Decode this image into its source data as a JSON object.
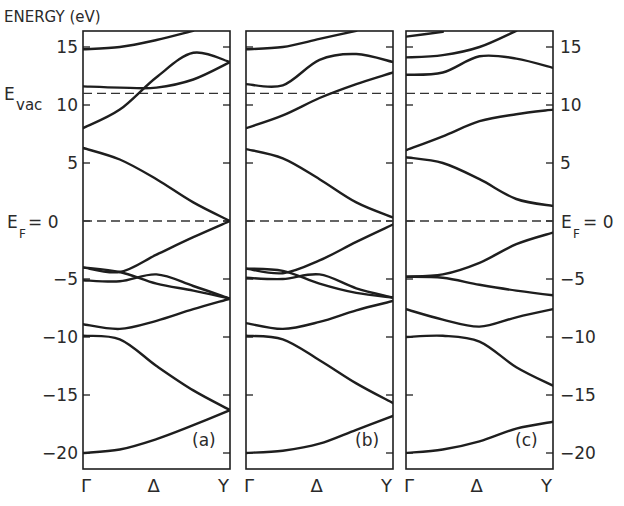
{
  "chart_data": {
    "type": "line",
    "title": "",
    "ylabel": "ENERGY (eV)",
    "xlabel": "",
    "ylim": [
      -20.7,
      16.4
    ],
    "yticks": [
      15,
      10,
      5,
      0,
      -5,
      -10,
      -15,
      -20
    ],
    "ytick_labels": [
      "15",
      "10",
      "5",
      "0",
      "-5",
      "-10",
      "-15",
      "-20"
    ],
    "left_axis_labels": [
      "15",
      "10",
      "5",
      "-5",
      "-10",
      "-15",
      "-20"
    ],
    "right_axis_labels": [
      "15",
      "10",
      "5",
      "-5",
      "-10",
      "-15",
      "-20"
    ],
    "grid": false,
    "x_ticks": [
      "Γ",
      "Δ",
      "Y"
    ],
    "reference_lines": [
      {
        "name": "E_vac",
        "label_main": "E",
        "label_sub": "vac",
        "energy": 11.0,
        "style": "dashed"
      },
      {
        "name": "E_F",
        "label_main": "E",
        "label_sub": "F",
        "label_suffix": "= 0",
        "energy": 0.0,
        "style": "dashed"
      }
    ],
    "panels": [
      {
        "label": "(a)",
        "x": [
          0,
          0.25,
          0.5,
          0.75,
          1.0
        ],
        "bands": [
          {
            "name": "c3",
            "values": [
              14.8,
              15.0,
              15.6,
              16.4,
              null
            ]
          },
          {
            "name": "c2a",
            "values": [
              11.6,
              11.5,
              11.5,
              12.2,
              13.7
            ]
          },
          {
            "name": "c2b",
            "values": [
              8.0,
              9.6,
              12.4,
              14.5,
              13.7
            ]
          },
          {
            "name": "v1",
            "values": [
              6.3,
              5.3,
              3.6,
              1.6,
              0.0
            ]
          },
          {
            "name": "v2a",
            "values": [
              -4.0,
              -4.4,
              -2.9,
              -1.4,
              0.0
            ]
          },
          {
            "name": "v2b",
            "values": [
              -5.1,
              -5.2,
              -4.6,
              -5.6,
              -6.7
            ]
          },
          {
            "name": "v3a",
            "values": [
              -4.0,
              -4.4,
              -5.4,
              -6.0,
              -6.7
            ]
          },
          {
            "name": "v3b",
            "values": [
              -8.9,
              -9.3,
              -8.6,
              -7.6,
              -6.7
            ]
          },
          {
            "name": "v4",
            "values": [
              -9.9,
              -10.2,
              -12.5,
              -14.6,
              -16.3
            ]
          },
          {
            "name": "v5",
            "values": [
              -20.0,
              -19.7,
              -18.8,
              -17.6,
              -16.3
            ]
          }
        ]
      },
      {
        "label": "(b)",
        "x": [
          0,
          0.25,
          0.5,
          0.75,
          1.0
        ],
        "bands": [
          {
            "name": "c3",
            "values": [
              14.8,
              15.0,
              15.7,
              16.4,
              null
            ]
          },
          {
            "name": "c2a",
            "values": [
              11.8,
              11.7,
              13.9,
              14.4,
              13.7
            ]
          },
          {
            "name": "c2b",
            "values": [
              8.0,
              9.1,
              10.6,
              11.8,
              12.8
            ]
          },
          {
            "name": "v1",
            "values": [
              6.2,
              5.4,
              3.6,
              1.6,
              0.3
            ]
          },
          {
            "name": "v2a",
            "values": [
              -4.1,
              -4.5,
              -3.4,
              -1.8,
              -0.3
            ]
          },
          {
            "name": "v2b",
            "values": [
              -4.9,
              -5.0,
              -4.6,
              -5.8,
              -6.6
            ]
          },
          {
            "name": "v3a",
            "values": [
              -4.1,
              -4.3,
              -5.4,
              -6.2,
              -6.6
            ]
          },
          {
            "name": "v3b",
            "values": [
              -8.8,
              -9.3,
              -8.7,
              -7.7,
              -6.9
            ]
          },
          {
            "name": "v4",
            "values": [
              -9.9,
              -10.2,
              -12.0,
              -14.0,
              -15.7
            ]
          },
          {
            "name": "v5",
            "values": [
              -20.0,
              -19.8,
              -19.2,
              -18.0,
              -16.8
            ]
          }
        ]
      },
      {
        "label": "(c)",
        "x": [
          0,
          0.25,
          0.5,
          0.75,
          1.0
        ],
        "bands": [
          {
            "name": "c4",
            "values": [
              15.9,
              16.3,
              null,
              null,
              null
            ]
          },
          {
            "name": "c3",
            "values": [
              14.1,
              14.3,
              15.0,
              16.4,
              null
            ]
          },
          {
            "name": "c2",
            "values": [
              12.6,
              12.8,
              14.2,
              14.0,
              13.2
            ]
          },
          {
            "name": "c1",
            "values": [
              6.1,
              7.3,
              8.6,
              9.2,
              9.6
            ]
          },
          {
            "name": "v1",
            "values": [
              5.5,
              5.0,
              3.6,
              1.9,
              1.3
            ]
          },
          {
            "name": "v2a",
            "values": [
              -4.8,
              -4.6,
              -3.6,
              -2.0,
              -1.0
            ]
          },
          {
            "name": "v2b",
            "values": [
              -4.8,
              -4.9,
              -5.5,
              -6.0,
              -6.4
            ]
          },
          {
            "name": "v3",
            "values": [
              -7.6,
              -8.5,
              -9.1,
              -8.3,
              -7.6
            ]
          },
          {
            "name": "v4",
            "values": [
              -10.0,
              -9.9,
              -10.4,
              -12.6,
              -14.2
            ]
          },
          {
            "name": "v5",
            "values": [
              -20.0,
              -19.7,
              -19.0,
              -17.9,
              -17.3
            ]
          }
        ]
      }
    ]
  },
  "figure": {
    "y_axis_title": "ENERGY (eV)",
    "evac_main": "E",
    "evac_sub": "vac",
    "ef_main": "E",
    "ef_sub": "F",
    "ef_suffix": "= 0",
    "panel_labels": [
      "(a)",
      "(b)",
      "(c)"
    ],
    "x_labels": [
      "Γ",
      "Δ",
      "Y"
    ]
  }
}
